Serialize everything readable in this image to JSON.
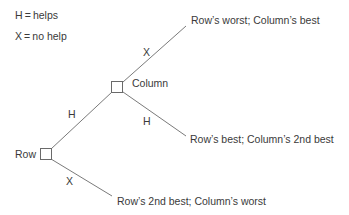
{
  "legend": {
    "h": "H = helps",
    "x": "X = no help"
  },
  "nodes": {
    "row": "Row",
    "column": "Column"
  },
  "edges": {
    "row_to_column": "H",
    "row_to_outcome": "X",
    "column_to_top": "X",
    "column_to_bottom": "H"
  },
  "outcomes": {
    "top": "Row’s worst; Column’s best",
    "middle": "Row’s best; Column’s 2nd best",
    "bottom": "Row’s 2nd best; Column’s worst"
  },
  "colors": {
    "line": "#7a7a7a",
    "text": "#3a3a3a"
  }
}
